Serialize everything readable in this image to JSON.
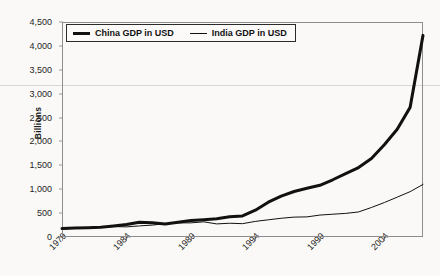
{
  "chart_data": {
    "type": "line",
    "title": "",
    "xlabel": "",
    "ylabel": "Billions",
    "xlim": [
      1979,
      2007
    ],
    "ylim": [
      0,
      4500
    ],
    "grid": false,
    "legend_position": "top-left",
    "x_tick_labels": [
      "1979",
      "1984",
      "1989",
      "1994",
      "1999",
      "2004"
    ],
    "x_tick_values": [
      1979,
      1984,
      1989,
      1994,
      1999,
      2004
    ],
    "y_tick_labels": [
      "0",
      "500",
      "1,000",
      "1,500",
      "2,000",
      "2,500",
      "3,000",
      "3,500",
      "4,000",
      "4,500"
    ],
    "y_tick_values": [
      0,
      500,
      1000,
      1500,
      2000,
      2500,
      3000,
      3500,
      4000,
      4500
    ],
    "x": [
      1979,
      1980,
      1981,
      1982,
      1983,
      1984,
      1985,
      1986,
      1987,
      1988,
      1989,
      1990,
      1991,
      1992,
      1993,
      1994,
      1995,
      1996,
      1997,
      1998,
      1999,
      2000,
      2001,
      2002,
      2003,
      2004,
      2005,
      2006,
      2007
    ],
    "series": [
      {
        "name": "China GDP in USD",
        "style": "thick",
        "color": "#111111",
        "values": [
          178,
          190,
          195,
          205,
          230,
          260,
          307,
          300,
          272,
          310,
          345,
          360,
          380,
          425,
          440,
          560,
          728,
          856,
          952,
          1019,
          1083,
          1198,
          1325,
          1454,
          1641,
          1932,
          2257,
          2713,
          4220
        ]
      },
      {
        "name": "India GDP in USD",
        "style": "thin",
        "color": "#111111",
        "values": [
          160,
          186,
          193,
          200,
          218,
          212,
          232,
          249,
          279,
          296,
          296,
          317,
          274,
          288,
          279,
          327,
          360,
          392,
          416,
          421,
          459,
          477,
          494,
          524,
          618,
          721,
          834,
          949,
          1100
        ]
      }
    ]
  },
  "legend": {
    "entries": [
      {
        "label": "China GDP in USD"
      },
      {
        "label": "India GDP in USD"
      }
    ]
  },
  "axes": {
    "y_axis_title": "Billions"
  }
}
